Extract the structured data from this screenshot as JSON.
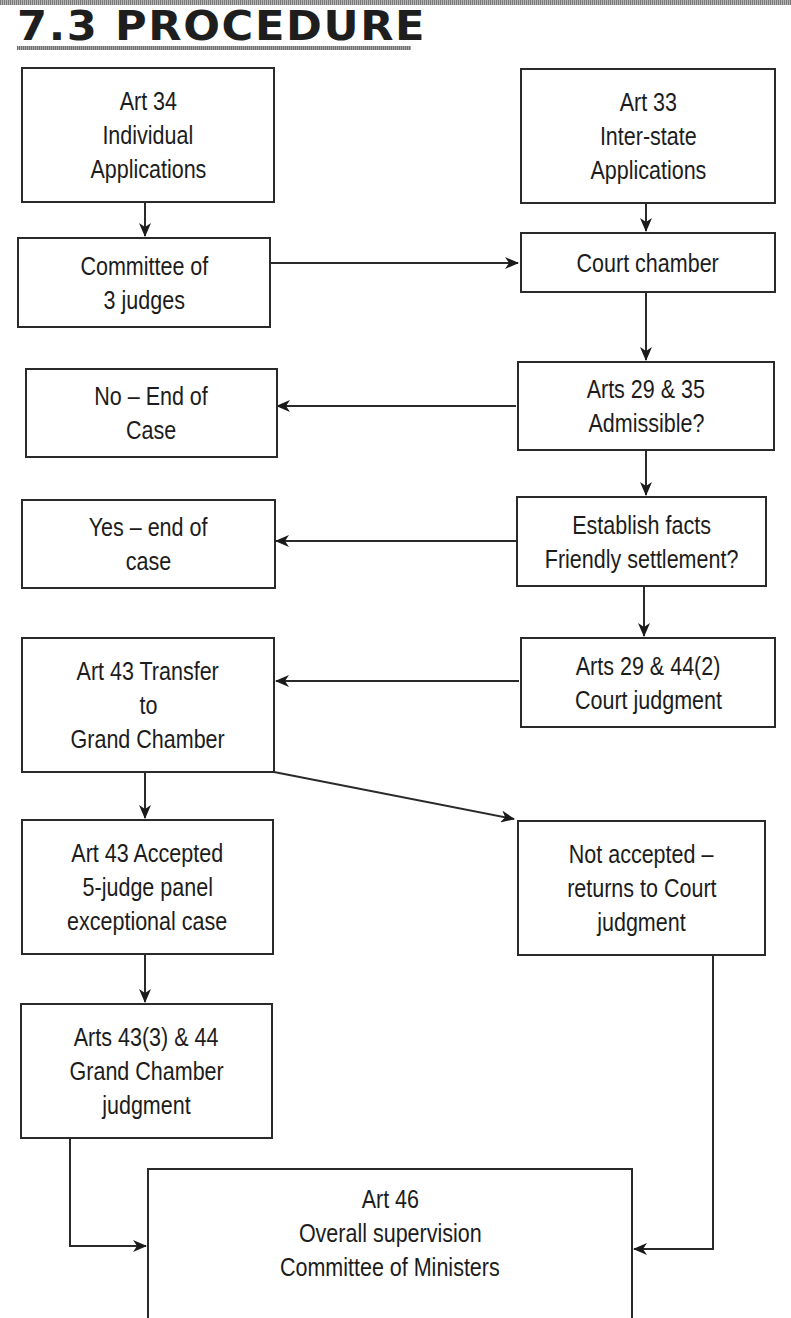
{
  "page": {
    "title": "7.3 PROCEDURE"
  },
  "colors": {
    "line": "#2a2a2a",
    "text": "#1c1c1c",
    "background": "#ffffff"
  },
  "diagram": {
    "type": "flowchart",
    "nodes": {
      "art34": {
        "lines": [
          "Art 34",
          "Individual",
          "Applications"
        ]
      },
      "art33": {
        "lines": [
          "Art 33",
          "Inter-state",
          "Applications"
        ]
      },
      "committee3": {
        "lines": [
          "Committee of",
          "3 judges"
        ]
      },
      "court_chamber": {
        "lines": [
          "Court chamber"
        ]
      },
      "no_end": {
        "lines": [
          "No – End of",
          "Case"
        ]
      },
      "admissible": {
        "lines": [
          "Arts 29 & 35",
          "Admissible?"
        ]
      },
      "yes_end": {
        "lines": [
          "Yes – end of",
          "case"
        ]
      },
      "establish": {
        "lines": [
          "Establish facts",
          "Friendly settlement?"
        ]
      },
      "transfer": {
        "lines": [
          "Art 43 Transfer",
          "to",
          "Grand Chamber"
        ]
      },
      "court_judgment": {
        "lines": [
          "Arts 29 & 44(2)",
          "Court judgment"
        ]
      },
      "accepted": {
        "lines": [
          "Art 43 Accepted",
          "5-judge panel",
          "exceptional case"
        ]
      },
      "not_accepted": {
        "lines": [
          "Not accepted –",
          "returns to Court",
          "judgment"
        ]
      },
      "grand_judgment": {
        "lines": [
          "Arts 43(3) & 44",
          "Grand Chamber",
          "judgment"
        ]
      },
      "art46": {
        "lines": [
          "Art 46",
          "Overall supervision",
          "Committee of Ministers"
        ]
      }
    },
    "edges": [
      {
        "from": "art34",
        "to": "committee3"
      },
      {
        "from": "art33",
        "to": "court_chamber"
      },
      {
        "from": "committee3",
        "to": "court_chamber"
      },
      {
        "from": "court_chamber",
        "to": "admissible"
      },
      {
        "from": "admissible",
        "to": "no_end"
      },
      {
        "from": "admissible",
        "to": "establish"
      },
      {
        "from": "establish",
        "to": "yes_end"
      },
      {
        "from": "establish",
        "to": "court_judgment"
      },
      {
        "from": "court_judgment",
        "to": "transfer"
      },
      {
        "from": "transfer",
        "to": "accepted"
      },
      {
        "from": "transfer",
        "to": "not_accepted"
      },
      {
        "from": "accepted",
        "to": "grand_judgment"
      },
      {
        "from": "grand_judgment",
        "to": "art46"
      },
      {
        "from": "not_accepted",
        "to": "art46"
      }
    ]
  }
}
